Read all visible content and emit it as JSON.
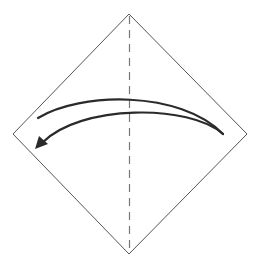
{
  "diagram": {
    "type": "origami-step",
    "colors": {
      "background": "#ffffff",
      "paper_outline": "#555555",
      "crease": "#777777",
      "arrow": "#2a2a2a"
    },
    "paper": {
      "shape": "diamond",
      "vertices": {
        "top": [
          129,
          14
        ],
        "right": [
          247,
          134
        ],
        "bottom": [
          129,
          254
        ],
        "left": [
          13,
          134
        ]
      }
    },
    "crease_line": {
      "style": "dashed",
      "from": [
        129,
        16
      ],
      "to": [
        129,
        252
      ]
    },
    "fold_arrow": {
      "direction": "right-to-left",
      "start": [
        38,
        118
      ],
      "end_tip": [
        35,
        149
      ],
      "turn_point": [
        223,
        134
      ]
    }
  }
}
